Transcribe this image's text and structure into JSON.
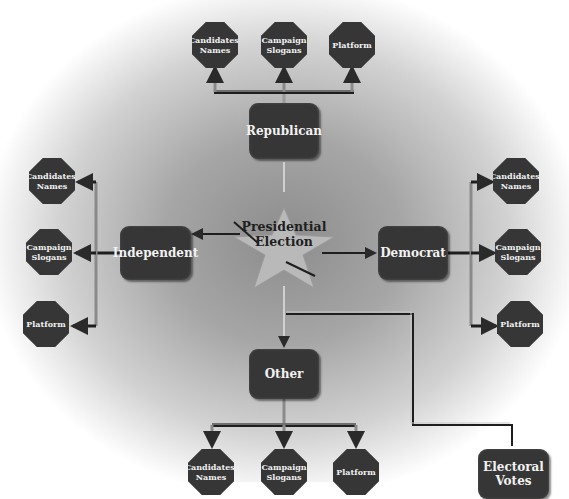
{
  "diagram": {
    "center": {
      "label_line1": "Presidential",
      "label_line2": "Election",
      "shape": "star"
    },
    "republican": {
      "label": "Republican",
      "children": [
        {
          "line1": "Candidates'",
          "line2": "Names"
        },
        {
          "line1": "Campaign",
          "line2": "Slogans"
        },
        {
          "line1": "Platform",
          "line2": ""
        }
      ]
    },
    "independent": {
      "label": "Independent",
      "children": [
        {
          "line1": "Candidates'",
          "line2": "Names"
        },
        {
          "line1": "Campaign",
          "line2": "Slogans"
        },
        {
          "line1": "Platform",
          "line2": ""
        }
      ]
    },
    "democrat": {
      "label": "Democrat",
      "children": [
        {
          "line1": "Candidates'",
          "line2": "Names"
        },
        {
          "line1": "Campaign",
          "line2": "Slogans"
        },
        {
          "line1": "Platform",
          "line2": ""
        }
      ]
    },
    "other": {
      "label": "Other",
      "children": [
        {
          "line1": "Candidates'",
          "line2": "Names"
        },
        {
          "line1": "Campaign",
          "line2": "Slogans"
        },
        {
          "line1": "Platform",
          "line2": ""
        }
      ]
    },
    "electoral": {
      "line1": "Electoral",
      "line2": "Votes"
    },
    "colors": {
      "node": "#363636",
      "node_text": "#f2f2f2",
      "star": "#b9b9b9",
      "connector_dark": "#1e1e1e",
      "connector_light": "#9a9a9a"
    }
  }
}
